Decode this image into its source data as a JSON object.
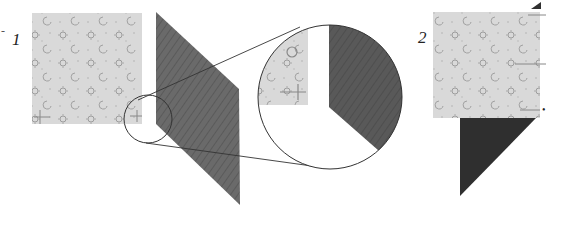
{
  "diagram": {
    "steps": [
      {
        "number": "1",
        "description": "Light print square beside dark parallelogram, with magnified detail of the corner"
      },
      {
        "number": "2",
        "description": "Light print square placed over dark triangle"
      }
    ],
    "colors": {
      "light_fabric": "#d8d8d8",
      "light_motif": "#9a9a9a",
      "dark_fabric": "#6b6b6b",
      "dark_triangle": "#303030",
      "outline": "#333333",
      "background": "#ffffff"
    },
    "marks": {
      "edge_tick": "-",
      "dot": "•"
    }
  }
}
